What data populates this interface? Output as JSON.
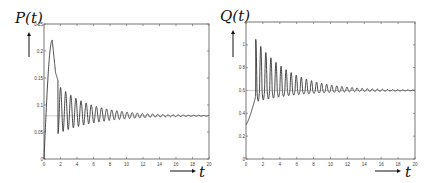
{
  "chart_data": [
    {
      "type": "line",
      "title": "",
      "ylabel": "P(t)",
      "xlabel": "t",
      "xlim": [
        0,
        20
      ],
      "ylim": [
        0,
        0.25
      ],
      "xticks": [
        0,
        2,
        4,
        6,
        8,
        10,
        12,
        14,
        16,
        18,
        20
      ],
      "xtick_labels": [
        "0",
        "2",
        "4",
        "6",
        "8",
        "10",
        "12",
        "14",
        "16",
        "18",
        "20"
      ],
      "yticks": [
        0,
        0.05,
        0.1,
        0.15,
        0.2,
        0.25
      ],
      "ytick_labels": [
        "0",
        "0.05",
        "0.1",
        "0.15",
        "0.2",
        "0.25"
      ],
      "grid": false,
      "equilibrium": 0.08,
      "series": [
        {
          "name": "P(t)",
          "description": "Rises from 0 to peak ~0.22 at t~1, shoulder ~0.16 at t~1.4, then damped oscillations (period ~0.6) settling to 0.08",
          "x": [
            0,
            0.3,
            0.6,
            0.9,
            1.0,
            1.2,
            1.4,
            1.6,
            1.8,
            2.0,
            2.3,
            2.6,
            2.9,
            3.2,
            3.5,
            3.8,
            4.1,
            5,
            6,
            8,
            10,
            12,
            14,
            16,
            18,
            20
          ],
          "y": [
            0,
            0.1,
            0.18,
            0.215,
            0.22,
            0.19,
            0.16,
            0.155,
            0.11,
            0.13,
            0.075,
            0.115,
            0.07,
            0.1,
            0.072,
            0.098,
            0.072,
            0.095,
            0.092,
            0.088,
            0.086,
            0.083,
            0.082,
            0.081,
            0.08,
            0.08
          ]
        }
      ]
    },
    {
      "type": "line",
      "title": "",
      "ylabel": "Q(t)",
      "xlabel": "t",
      "xlim": [
        0,
        20
      ],
      "ylim": [
        0,
        1.2
      ],
      "xticks": [
        0,
        2,
        4,
        6,
        8,
        10,
        12,
        14,
        16,
        18,
        20
      ],
      "xtick_labels": [
        "0",
        "2",
        "4",
        "6",
        "8",
        "10",
        "12",
        "14",
        "16",
        "18",
        "20"
      ],
      "yticks": [
        0,
        0.2,
        0.4,
        0.6,
        0.8,
        1.0
      ],
      "ytick_labels": [
        "0",
        "0.2",
        "0.4",
        "0.6",
        "0.8",
        "1"
      ],
      "grid": false,
      "equilibrium": 0.6,
      "series": [
        {
          "name": "Q(t)",
          "description": "Starts ~0.3, rises to ~0.55 by t~1.1, spikes to ~1.05 at t~1.2, then damped oscillations (period ~0.6, min ~0.5) settling to 0.6",
          "x": [
            0,
            0.5,
            1.0,
            1.2,
            1.5,
            1.8,
            2.1,
            2.4,
            3,
            4,
            5,
            6,
            8,
            10,
            12,
            14,
            16,
            18,
            20
          ],
          "y": [
            0.3,
            0.42,
            0.55,
            1.05,
            0.55,
            1.0,
            0.5,
            0.92,
            0.83,
            0.77,
            0.74,
            0.71,
            0.68,
            0.65,
            0.63,
            0.62,
            0.61,
            0.605,
            0.6
          ]
        }
      ]
    }
  ],
  "panels": [
    {
      "ylabel": "P(t)",
      "xlabel": "t"
    },
    {
      "ylabel": "Q(t)",
      "xlabel": "t"
    }
  ]
}
